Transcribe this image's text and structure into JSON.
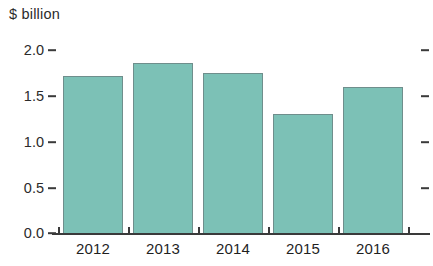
{
  "chart_data": {
    "type": "bar",
    "title": "",
    "ylabel": "$ billion",
    "xlabel": "",
    "categories": [
      "2012",
      "2013",
      "2014",
      "2015",
      "2016"
    ],
    "values": [
      1.72,
      1.86,
      1.75,
      1.3,
      1.6
    ],
    "ylim": [
      0.0,
      2.0
    ],
    "yticks": [
      "0.0",
      "0.5",
      "1.0",
      "1.5",
      "2.0"
    ],
    "ytick_values": [
      0.0,
      0.5,
      1.0,
      1.5,
      2.0
    ],
    "grid": false,
    "legend": "none",
    "series": [
      {
        "name": "$ billion",
        "values": [
          1.72,
          1.86,
          1.75,
          1.3,
          1.6
        ]
      }
    ],
    "colors": {
      "bar_fill": "#7cc1b6",
      "bar_border": "#6f8e8c",
      "axis": "#3a3a3a",
      "text": "#1f1f1f",
      "background": "#ffffff"
    }
  }
}
